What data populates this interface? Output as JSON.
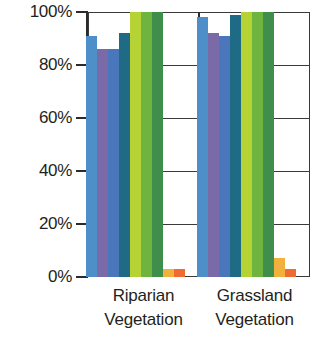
{
  "chart_data": {
    "type": "bar",
    "title": "",
    "subtitle": "",
    "xlabel": "",
    "ylabel": "",
    "ylim": [
      0,
      100
    ],
    "grid": true,
    "legend_position": "none",
    "y_unit": "%",
    "categories": [
      "Riparian Vegetation",
      "Grassland Vegetation"
    ],
    "category_lines": [
      [
        "Riparian",
        "Vegetation"
      ],
      [
        "Grassland",
        "Vegetation"
      ]
    ],
    "y_ticks": [
      {
        "value": 100,
        "label": "100%"
      },
      {
        "value": 80,
        "label": "80%"
      },
      {
        "value": 60,
        "label": "60%"
      },
      {
        "value": 40,
        "label": "40%"
      },
      {
        "value": 20,
        "label": "20%"
      },
      {
        "value": 0,
        "label": "0%"
      }
    ],
    "series": [
      {
        "name": "series-1",
        "color": "#4e8fc9",
        "values": [
          91,
          98
        ]
      },
      {
        "name": "series-2",
        "color": "#7b6aa8",
        "values": [
          86,
          92
        ]
      },
      {
        "name": "series-3",
        "color": "#4a77bc",
        "values": [
          86,
          91
        ]
      },
      {
        "name": "series-4",
        "color": "#1f6b86",
        "values": [
          92,
          99
        ]
      },
      {
        "name": "series-5",
        "color": "#b5d334",
        "values": [
          100,
          100
        ]
      },
      {
        "name": "series-6",
        "color": "#6fb43f",
        "values": [
          100,
          100
        ]
      },
      {
        "name": "series-7",
        "color": "#3f8f4a",
        "values": [
          100,
          100
        ]
      },
      {
        "name": "series-8",
        "color": "#f2b13c",
        "values": [
          3,
          7
        ]
      },
      {
        "name": "series-9",
        "color": "#ef6b32",
        "values": [
          3,
          3
        ]
      }
    ]
  }
}
